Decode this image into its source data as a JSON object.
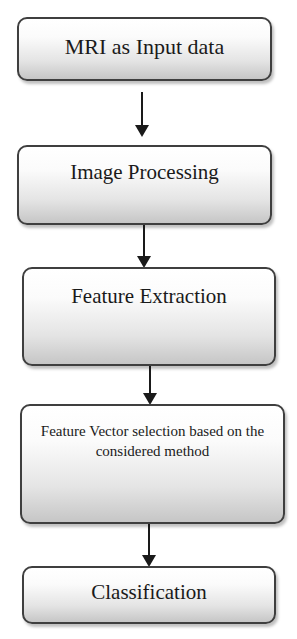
{
  "diagram": {
    "type": "flowchart",
    "direction": "top-to-bottom",
    "nodes": [
      {
        "id": "n1",
        "label": "MRI as Input data"
      },
      {
        "id": "n2",
        "label": "Image Processing"
      },
      {
        "id": "n3",
        "label": "Feature Extraction"
      },
      {
        "id": "n4",
        "label": "Feature Vector selection based on the considered method"
      },
      {
        "id": "n5",
        "label": "Classification"
      }
    ],
    "edges": [
      {
        "from": "n1",
        "to": "n2"
      },
      {
        "from": "n2",
        "to": "n3"
      },
      {
        "from": "n3",
        "to": "n4"
      },
      {
        "from": "n4",
        "to": "n5"
      }
    ]
  },
  "style": {
    "box_border": "#3f3f3f",
    "box_gradient_top": "#ffffff",
    "box_gradient_bottom": "#c6c6c6",
    "arrow_color": "#1a1a1a",
    "background": "#ffffff"
  }
}
